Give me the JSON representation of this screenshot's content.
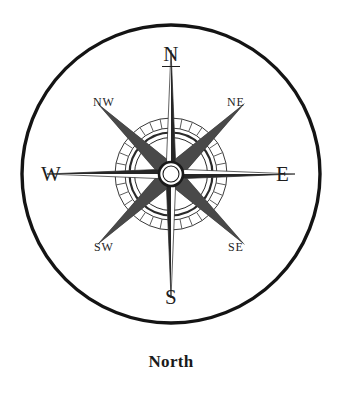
{
  "figure": {
    "caption": "North",
    "background_color": "#ffffff",
    "ink_color": "#1e1e1e"
  },
  "compass": {
    "center_x": 171,
    "center_y": 174,
    "outer_circle_radius": 149,
    "outer_circle_stroke_width": 3.4,
    "tick_ring_outer_radius": 56,
    "tick_ring_inner_radius": 46,
    "tick_count": 32,
    "inner_ring_outer_radius": 41,
    "inner_ring_inner_radius": 37,
    "hub_outer_radius": 12,
    "hub_inner_radius": 8,
    "cardinal_point_length": 124,
    "ordinal_point_length": 104,
    "labels": {
      "north": "N",
      "east": "E",
      "south": "S",
      "west": "W",
      "northeast": "NE",
      "northwest": "NW",
      "southeast": "SE",
      "southwest": "SW"
    },
    "north_label_underlined": true
  },
  "chart_data": {
    "type": "diagram",
    "title": "North",
    "subtitle": "",
    "diagram_kind": "compass-rose",
    "categories": [
      "N",
      "NE",
      "E",
      "SE",
      "S",
      "SW",
      "W",
      "NW"
    ],
    "bearings_degrees": [
      0,
      45,
      90,
      135,
      180,
      225,
      270,
      315
    ],
    "point_styles": [
      "cardinal-needle",
      "ordinal-kite",
      "cardinal-needle",
      "ordinal-kite",
      "cardinal-needle",
      "ordinal-kite",
      "cardinal-needle",
      "ordinal-kite"
    ],
    "labels": [
      "N",
      "NE",
      "E",
      "SE",
      "S",
      "SW",
      "W",
      "NW"
    ],
    "highlighted": "N",
    "legend": [],
    "annotations": [
      "North"
    ],
    "grid": false
  }
}
